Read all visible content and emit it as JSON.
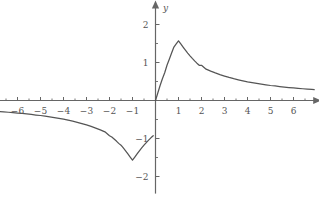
{
  "figure": {
    "background_color": "#ffffff",
    "axis_color": "#666666",
    "curve_color": "#555555",
    "label_color": "#555555",
    "width": 319,
    "height": 203
  },
  "axes": {
    "x_axis_label": "x",
    "y_axis_label": "y",
    "x_tick_labels": [
      "-6",
      "-5",
      "-4",
      "-3",
      "-2",
      "-1",
      "1",
      "2",
      "3",
      "4",
      "5",
      "6"
    ],
    "y_tick_labels": [
      "2",
      "1",
      "-1",
      "-2"
    ],
    "minus_glyph": "−"
  },
  "chart_data": {
    "type": "line",
    "title": "",
    "xlabel": "x",
    "ylabel": "y",
    "xlim": [
      -6.8,
      6.9
    ],
    "ylim": [
      -2.45,
      2.45
    ],
    "grid": false,
    "legend": false,
    "x_ticks": [
      -6,
      -5,
      -4,
      -3,
      -2,
      -1,
      1,
      2,
      3,
      4,
      5,
      6
    ],
    "y_ticks": [
      -2,
      -1,
      1,
      2
    ],
    "x_minor_ticks": [
      -6.5,
      -5.5,
      -4.5,
      -3.5,
      -2.5,
      -1.5,
      -0.5,
      0.5,
      1.5,
      2.5,
      3.5,
      4.5,
      5.5,
      6.5
    ],
    "y_minor_ticks": [
      -1.5,
      -0.5,
      0.5,
      1.5
    ],
    "annotations": [
      {
        "text": "cusp maximum at x = 1, y = 1.5708"
      },
      {
        "text": "cusp minimum at x = -1, y = -1.5708"
      }
    ],
    "series": [
      {
        "name": "y = arcsin(2x/(1+x^2))",
        "x": [
          -6.8,
          -6.6,
          -6.4,
          -6.2,
          -6.0,
          -5.8,
          -5.6,
          -5.4,
          -5.2,
          -5.0,
          -4.8,
          -4.6,
          -4.4,
          -4.2,
          -4.0,
          -3.8,
          -3.6,
          -3.4,
          -3.2,
          -3.0,
          -2.8,
          -2.6,
          -2.4,
          -2.2,
          -2.0,
          -1.9,
          -1.8,
          -1.7,
          -1.6,
          -1.5,
          -1.4,
          -1.3,
          -1.2,
          -1.1,
          -1.0,
          -0.9,
          -0.8,
          -0.7,
          -0.6,
          -0.5,
          -0.4,
          -0.3,
          -0.2,
          -0.1,
          0.0,
          0.1,
          0.2,
          0.3,
          0.4,
          0.5,
          0.6,
          0.7,
          0.8,
          0.9,
          1.0,
          1.1,
          1.2,
          1.3,
          1.4,
          1.5,
          1.6,
          1.7,
          1.8,
          1.9,
          2.0,
          2.2,
          2.4,
          2.6,
          2.8,
          3.0,
          3.2,
          3.4,
          3.6,
          3.8,
          4.0,
          4.2,
          4.4,
          4.6,
          4.8,
          5.0,
          5.2,
          5.4,
          5.6,
          5.8,
          6.0,
          6.2,
          6.4,
          6.6,
          6.8,
          6.9
        ],
        "y": [
          -0.2913,
          -0.2999,
          -0.3093,
          -0.3193,
          -0.33,
          -0.3415,
          -0.3539,
          -0.3673,
          -0.3818,
          -0.3948,
          -0.4115,
          -0.4296,
          -0.4492,
          -0.4705,
          -0.49,
          -0.5167,
          -0.544,
          -0.5738,
          -0.6064,
          -0.6435,
          -0.6823,
          -0.7249,
          -0.7722,
          -0.8249,
          -0.9273,
          -0.9613,
          -1.0122,
          -1.068,
          -1.1284,
          -1.176,
          -1.249,
          -1.3258,
          -1.4056,
          -1.4876,
          -1.5708,
          -1.4876,
          -1.4056,
          -1.3258,
          -1.249,
          -1.176,
          -1.1071,
          -1.0425,
          -0.9823,
          -0.9273,
          0.0,
          0.1987,
          0.3948,
          0.5735,
          0.7297,
          0.9273,
          1.0847,
          1.249,
          1.4056,
          1.4876,
          1.5708,
          1.4876,
          1.4056,
          1.3258,
          1.249,
          1.176,
          1.1071,
          1.0425,
          0.9823,
          0.9273,
          0.9273,
          0.8249,
          0.7722,
          0.7249,
          0.6823,
          0.6435,
          0.6064,
          0.5738,
          0.544,
          0.5167,
          0.49,
          0.4705,
          0.4492,
          0.4296,
          0.4115,
          0.3948,
          0.3818,
          0.3673,
          0.3539,
          0.3415,
          0.33,
          0.3193,
          0.3093,
          0.2999,
          0.2913,
          0.287
        ]
      }
    ]
  }
}
